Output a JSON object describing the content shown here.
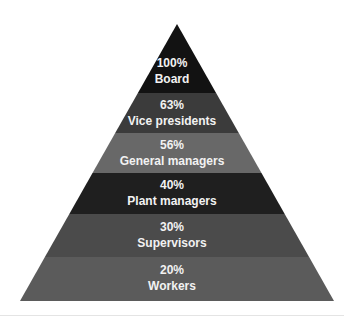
{
  "diagram": {
    "type": "pyramid",
    "apex": {
      "x": 177,
      "y": 24
    },
    "base": {
      "left": 20,
      "right": 334,
      "y": 301
    },
    "levels": [
      {
        "percent": "100%",
        "label": "Board",
        "color": "#121212",
        "top": 24,
        "bottom": 93
      },
      {
        "percent": "63%",
        "label": "Vice presidents",
        "color": "#3b3b3b",
        "top": 93,
        "bottom": 133
      },
      {
        "percent": "56%",
        "label": "General managers",
        "color": "#686868",
        "top": 133,
        "bottom": 173
      },
      {
        "percent": "40%",
        "label": "Plant managers",
        "color": "#1f1f1f",
        "top": 173,
        "bottom": 214
      },
      {
        "percent": "30%",
        "label": "Supervisors",
        "color": "#4b4b4b",
        "top": 214,
        "bottom": 257
      },
      {
        "percent": "20%",
        "label": "Workers",
        "color": "#5b5b5b",
        "top": 257,
        "bottom": 301
      }
    ]
  }
}
